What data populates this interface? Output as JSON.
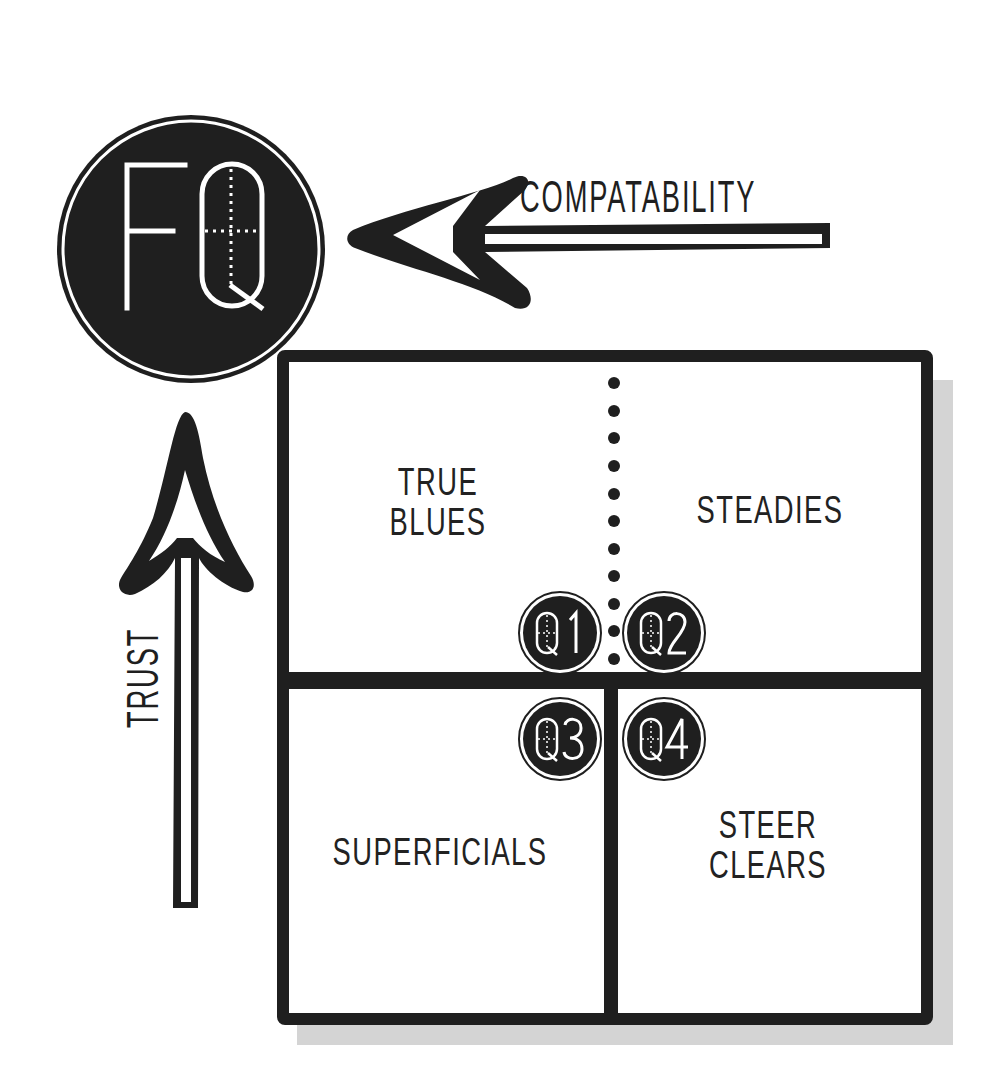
{
  "logo": {
    "letters": "FQ",
    "icon": "fq-logo-icon"
  },
  "axes": {
    "horizontal": {
      "label": "COMPATABILITY",
      "direction": "left",
      "icon": "arrow-left-icon"
    },
    "vertical": {
      "label": "TRUST",
      "direction": "up",
      "icon": "arrow-up-icon"
    }
  },
  "quadrants": [
    {
      "id": "Q1",
      "badge": "Q1",
      "name_lines": [
        "TRUE",
        "BLUES"
      ],
      "position": "top-left"
    },
    {
      "id": "Q2",
      "badge": "Q2",
      "name_lines": [
        "STEADIES"
      ],
      "position": "top-right"
    },
    {
      "id": "Q3",
      "badge": "Q3",
      "name_lines": [
        "SUPERFICIALS"
      ],
      "position": "bottom-left"
    },
    {
      "id": "Q4",
      "badge": "Q4",
      "name_lines": [
        "STEER",
        "CLEARS"
      ],
      "position": "bottom-right"
    }
  ],
  "colors": {
    "ink": "#1f1f1f",
    "background": "#ffffff",
    "shadow": "#d4d4d4"
  }
}
